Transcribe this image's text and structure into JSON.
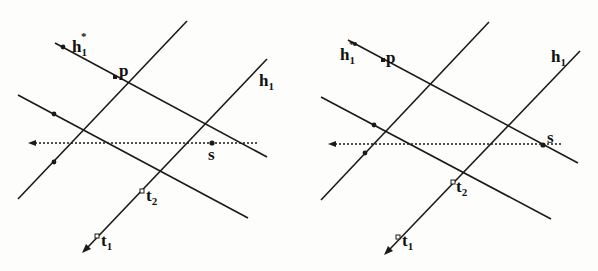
{
  "panels": [
    {
      "id": "left",
      "labels": {
        "h1_star": "h",
        "h1_star_sub": "1",
        "h1_star_sup": "*",
        "p": "p",
        "h1": "h",
        "h1_sub": "1",
        "s": "s",
        "t2": "t",
        "t2_sub": "2",
        "t1": "t",
        "t1_sub": "1"
      }
    },
    {
      "id": "right",
      "labels": {
        "h1_star": "h",
        "h1_star_sub": "1",
        "h1_star_sup": "*",
        "p": "p",
        "h1": "h",
        "h1_sub": "1",
        "s": "s",
        "t2": "t",
        "t2_sub": "2",
        "t1": "t",
        "t1_sub": "1"
      }
    }
  ],
  "colors": {
    "ink": "#1a1a1a",
    "background": "#fdfdfb"
  }
}
